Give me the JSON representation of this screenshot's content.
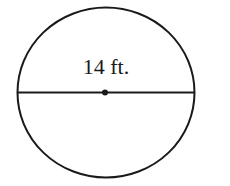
{
  "diagram": {
    "shape": "circle",
    "diameter_label": "14 ft.",
    "line_color": "#1a1a1a",
    "background": "#ffffff"
  }
}
